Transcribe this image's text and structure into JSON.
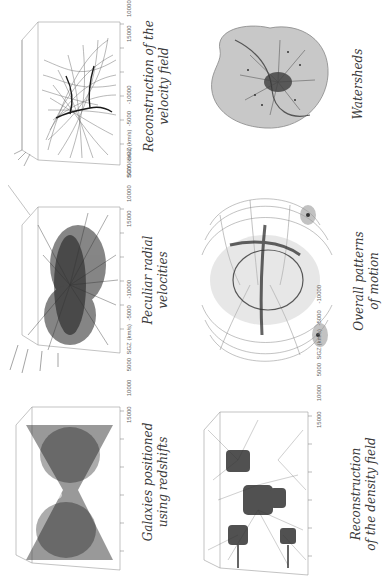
{
  "figure": {
    "orientation": "rotated 90deg counter-clockwise",
    "panels": [
      {
        "id": "galaxies",
        "caption_lines": [
          "Galaxies positioned",
          "using redshifts"
        ],
        "kind": "3d-scatter-box",
        "axis_z_label": "SGZ (km/s)",
        "z_ticks": [
          "15000",
          "10000",
          "5000",
          "0",
          "-5000",
          "-10000"
        ],
        "x_label": "SGY (km/s)",
        "x_ticks": [
          "-15000",
          "-10000",
          "-5000",
          "0",
          "5000",
          "10000",
          "15000"
        ]
      },
      {
        "id": "radial-velocities",
        "caption_lines": [
          "Peculiar radial",
          "velocities"
        ],
        "kind": "3d-vector-box",
        "axis_z_label": "SGZ (km/s)",
        "z_ticks": [
          "15000",
          "10000",
          "5000",
          "0",
          "-5000",
          "-10000"
        ],
        "x_label": "SGY (km/s)",
        "x_ticks": [
          "-15000",
          "-10000",
          "-5000",
          "0",
          "5000",
          "10000",
          "15000"
        ]
      },
      {
        "id": "velocity-field",
        "caption_lines": [
          "Reconstruction of the",
          "velocity field"
        ],
        "kind": "3d-streamline-box",
        "axis_z_label": "SGZ (km/s)",
        "z_ticks": [
          "15000",
          "10000",
          "5000",
          "0",
          "-5000",
          "-10000"
        ],
        "x_label": "SGY (km/s)",
        "x_ticks": [
          "-15000",
          "-10000",
          "-5000",
          "0",
          "5000",
          "10000",
          "15000"
        ]
      },
      {
        "id": "density-field",
        "caption_lines": [
          "Reconstruction",
          "of the density field"
        ],
        "kind": "3d-isosurface-box",
        "axis_z_label": "SGZ (km/s)",
        "z_ticks": [
          "15000",
          "10000",
          "5000",
          "0",
          "-5000",
          "-10000"
        ],
        "x_label": "SGY (km/s)",
        "x_ticks": [
          "-15000",
          "-10000",
          "-5000",
          "0",
          "5000",
          "10000",
          "15000"
        ]
      },
      {
        "id": "overall-motion",
        "caption_lines": [
          "Overall patterns",
          "of motion"
        ],
        "kind": "3d-render"
      },
      {
        "id": "watersheds",
        "caption_lines": [
          "Watersheds"
        ],
        "kind": "3d-render"
      }
    ]
  },
  "colors": {
    "background": "#ffffff",
    "ink": "#222222",
    "grid": "#9a9a9a",
    "shade": "#bdbdbd",
    "caption": "#3a3a3a"
  }
}
